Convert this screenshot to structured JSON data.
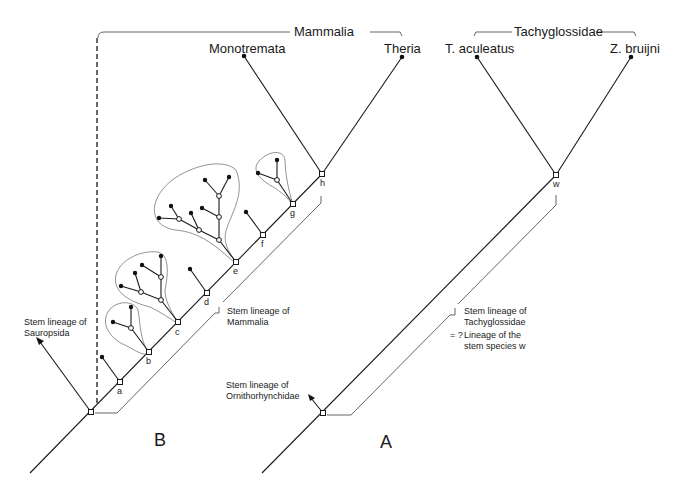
{
  "panel_b": {
    "label": "B",
    "clade_label": "Mammalia",
    "taxa": {
      "left": "Monotremata",
      "right": "Theria"
    },
    "stem_sauropsida": [
      "Stem lineage of",
      "Sauropsida"
    ],
    "stem_mammalia": [
      "Stem lineage of",
      "Mammalia"
    ],
    "nodes": [
      "a",
      "b",
      "c",
      "d",
      "e",
      "f",
      "g",
      "h"
    ]
  },
  "panel_a": {
    "label": "A",
    "clade_label": "Tachyglossidae",
    "taxa": {
      "left": "T. aculeatus",
      "right": "Z. bruijni"
    },
    "stem_ornithorhynchidae": [
      "Stem lineage of",
      "Ornithorhynchidae"
    ],
    "stem_tachyglossidae": [
      "Stem lineage of",
      "Tachyglossidae"
    ],
    "equivalence_prefix": "= ?",
    "stem_species_note": [
      "Lineage of the",
      "stem species  w"
    ],
    "node": "w"
  }
}
